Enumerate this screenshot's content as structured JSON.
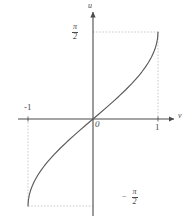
{
  "figure": {
    "title": "",
    "background_color": "#ffffff",
    "ink_color": "#4a4a4a",
    "guide_color": "#b9b9b9",
    "curve_color": "#5a5a5a"
  },
  "labels": {
    "origin": "0",
    "x_tick_one": "1",
    "x_tick_neg_one": "-1",
    "x_axis_name": "v",
    "y_axis_name": "u",
    "pi_numerator": "π",
    "pi_denominator": "2",
    "minus_sign": "−"
  },
  "chart_data": {
    "type": "line",
    "title": "",
    "xlabel": "v",
    "ylabel": "u",
    "xlim": [
      -1.35,
      1.42
    ],
    "ylim": [
      -1.92,
      1.92
    ],
    "grid": false,
    "legend": null,
    "xticks": [
      -1,
      0,
      1
    ],
    "xticklabels": [
      "-1",
      "0",
      "1"
    ],
    "yticks": [
      -1.5708,
      1.5708
    ],
    "yticklabels": [
      "-π/2",
      "π/2"
    ],
    "annotations": [
      {
        "text": "π/2",
        "x": -0.25,
        "y": 1.5708,
        "note": "stacked fraction left of y-axis at top dashed line"
      },
      {
        "text": "−π/2",
        "x": 0.3,
        "y": -1.5708,
        "note": "stacked fraction right of y-axis at bottom dashed line"
      },
      {
        "text": "0",
        "x": 0.04,
        "y": -0.12,
        "note": "origin label below-right of origin"
      },
      {
        "text": "1",
        "x": 1.0,
        "y": -0.18,
        "note": "x tick label below axis"
      },
      {
        "text": "-1",
        "x": -1.0,
        "y": 0.2,
        "note": "x tick label above axis"
      }
    ],
    "guides": [
      {
        "kind": "hline",
        "y": 1.5708,
        "x_from": 0,
        "x_to": 1,
        "style": "dashed"
      },
      {
        "kind": "vline",
        "x": 1,
        "y_from": 0,
        "y_to": 1.5708,
        "style": "dashed"
      },
      {
        "kind": "hline",
        "y": -1.5708,
        "x_from": -1,
        "x_to": 0,
        "style": "dashed"
      },
      {
        "kind": "vline",
        "x": -1,
        "y_from": -1.5708,
        "y_to": 0,
        "style": "dashed"
      }
    ],
    "series": [
      {
        "name": "arcsin(v)",
        "x": [
          -1.0,
          -0.995,
          -0.98,
          -0.96,
          -0.93,
          -0.9,
          -0.85,
          -0.8,
          -0.75,
          -0.7,
          -0.6,
          -0.5,
          -0.4,
          -0.3,
          -0.2,
          -0.1,
          0.0,
          0.1,
          0.2,
          0.3,
          0.4,
          0.5,
          0.6,
          0.7,
          0.75,
          0.8,
          0.85,
          0.9,
          0.93,
          0.96,
          0.98,
          0.995,
          1.0
        ],
        "y": [
          -1.5708,
          -1.4709,
          -1.3705,
          -1.287,
          -1.1944,
          -1.1198,
          -1.0161,
          -0.9273,
          -0.8481,
          -0.7754,
          -0.6435,
          -0.5236,
          -0.4115,
          -0.3047,
          -0.2014,
          -0.1002,
          0.0,
          0.1002,
          0.2014,
          0.3047,
          0.4115,
          0.5236,
          0.6435,
          0.7754,
          0.8481,
          0.9273,
          1.0161,
          1.1198,
          1.1944,
          1.287,
          1.3705,
          1.4709,
          1.5708
        ]
      }
    ]
  },
  "geometry": {
    "origin_px": [
      93,
      119
    ],
    "x_unit_px": 65,
    "y_unit_px": 55.4,
    "x_axis_from_px": 18,
    "x_axis_to_px": 176,
    "y_axis_from_px": 10,
    "y_axis_to_px": 216
  }
}
